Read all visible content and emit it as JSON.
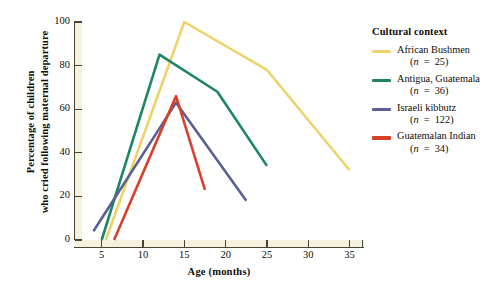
{
  "chart_data": {
    "type": "line",
    "title": "",
    "xlabel": "Age (months)",
    "ylabel": "Percentage of children who cried following maternal departure",
    "ylabel_line1": "Percentage of children",
    "ylabel_line2": "who cried following maternal departure",
    "xlim": [
      2.5,
      36.5
    ],
    "ylim": [
      0,
      100
    ],
    "xticks": [
      5,
      10,
      15,
      20,
      25,
      30,
      35
    ],
    "yticks": [
      0,
      20,
      40,
      60,
      80,
      100
    ],
    "grid": false,
    "legend_position": "right",
    "legend_title": "Cultural context",
    "series": [
      {
        "name": "African Bushmen",
        "n": 25,
        "n_label": "(n = 25)",
        "color": "#edd36a",
        "x": [
          5.5,
          15,
          25,
          35
        ],
        "y": [
          0,
          100,
          78,
          32
        ]
      },
      {
        "name": "Antigua, Guatemala",
        "n": 36,
        "n_label": "(n = 36)",
        "color": "#1d8662",
        "x": [
          5,
          12,
          19,
          25
        ],
        "y": [
          0,
          85,
          68,
          34
        ]
      },
      {
        "name": "Israeli kibbutz",
        "n": 122,
        "n_label": "(n = 122)",
        "color": "#5a5f94",
        "x": [
          4,
          14,
          22.5
        ],
        "y": [
          4,
          63,
          18
        ]
      },
      {
        "name": "Guatemalan Indian",
        "n": 34,
        "n_label": "(n = 34)",
        "color": "#d8402a",
        "x": [
          6.5,
          14,
          17.5
        ],
        "y": [
          0,
          66,
          23
        ]
      }
    ]
  },
  "axis": {
    "x_tick_labels": [
      "5",
      "10",
      "15",
      "20",
      "25",
      "30",
      "35"
    ],
    "y_tick_labels": [
      "0",
      "20",
      "40",
      "60",
      "80",
      "100"
    ]
  },
  "colors": {
    "axis": "#4a4637",
    "axis_band": "#f5f1dc",
    "text": "#100d08",
    "plot_bg": "#ffffff"
  }
}
